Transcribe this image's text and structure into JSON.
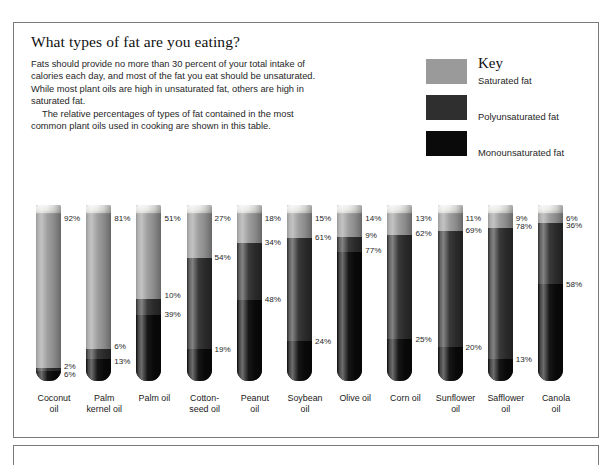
{
  "top_sliver_text": "",
  "panel": {
    "headline": "What types of fat are you eating?",
    "intro_paragraph_1": "Fats should provide no more than 30 percent of your total intake of calories each day, and most of the fat you eat should be unsaturated. While most plant oils are high in unsaturated fat, others are high in saturated fat.",
    "intro_paragraph_2": "The relative percentages of types of fat contained in the most common plant oils used in cooking are shown in this table."
  },
  "key": {
    "title": "Key",
    "items": [
      {
        "label": "Saturated fat",
        "color": "#9a9a9a",
        "swatch_name": "saturated-fat-swatch"
      },
      {
        "label": "Polyunsaturated fat",
        "color": "#2f2f2f",
        "swatch_name": "polyunsaturated-fat-swatch"
      },
      {
        "label": "Monounsaturated fat",
        "color": "#0a0a0a",
        "swatch_name": "monounsaturated-fat-swatch"
      }
    ]
  },
  "chart_data": {
    "type": "bar",
    "title": "What types of fat are you eating?",
    "subtype": "stacked-100-percent-test-tube",
    "xlabel": "",
    "ylabel": "Percent of total fat",
    "ylim": [
      0,
      100
    ],
    "grid": false,
    "legend_position": "top-right",
    "unit": "%",
    "categories": [
      "Coconut oil",
      "Palm kernel oil",
      "Palm oil",
      "Cotton-seed oil",
      "Peanut oil",
      "Soybean oil",
      "Olive oil",
      "Corn oil",
      "Sunflower oil",
      "Safflower oil",
      "Canola oil"
    ],
    "series": [
      {
        "name": "Saturated fat",
        "color": "#9a9a9a",
        "values": [
          92,
          81,
          51,
          27,
          18,
          15,
          14,
          13,
          11,
          9,
          6
        ]
      },
      {
        "name": "Polyunsaturated fat",
        "color": "#2f2f2f",
        "values": [
          2,
          6,
          10,
          54,
          34,
          61,
          9,
          62,
          69,
          78,
          36
        ]
      },
      {
        "name": "Monounsaturated fat",
        "color": "#0a0a0a",
        "values": [
          6,
          13,
          39,
          19,
          48,
          24,
          77,
          25,
          20,
          13,
          58
        ]
      }
    ]
  },
  "tubes": [
    {
      "name_line1": "Coconut",
      "name_line2": "oil",
      "sat": 92,
      "poly": 2,
      "mono": 6,
      "labels": [
        {
          "text": "92%",
          "side": "right",
          "at": 3
        },
        {
          "text": "2%",
          "side": "right",
          "at": 91
        },
        {
          "text": "6%",
          "side": "right",
          "at": 96
        }
      ]
    },
    {
      "name_line1": "Palm",
      "name_line2": "kernel oil",
      "sat": 81,
      "poly": 6,
      "mono": 13,
      "labels": [
        {
          "text": "81%",
          "side": "right",
          "at": 3
        },
        {
          "text": "6%",
          "side": "right",
          "at": 79
        },
        {
          "text": "13%",
          "side": "right",
          "at": 88
        }
      ]
    },
    {
      "name_line1": "Palm oil",
      "name_line2": "",
      "sat": 51,
      "poly": 10,
      "mono": 39,
      "labels": [
        {
          "text": "51%",
          "side": "right",
          "at": 3
        },
        {
          "text": "10%",
          "side": "right",
          "at": 49
        },
        {
          "text": "39%",
          "side": "right",
          "at": 60
        }
      ]
    },
    {
      "name_line1": "Cotton-",
      "name_line2": "seed oil",
      "sat": 27,
      "poly": 54,
      "mono": 19,
      "labels": [
        {
          "text": "27%",
          "side": "right",
          "at": 3
        },
        {
          "text": "54%",
          "side": "right",
          "at": 26
        },
        {
          "text": "19%",
          "side": "right",
          "at": 81
        }
      ]
    },
    {
      "name_line1": "Peanut",
      "name_line2": "oil",
      "sat": 18,
      "poly": 34,
      "mono": 48,
      "labels": [
        {
          "text": "18%",
          "side": "right",
          "at": 3
        },
        {
          "text": "34%",
          "side": "right",
          "at": 17
        },
        {
          "text": "48%",
          "side": "right",
          "at": 51
        }
      ]
    },
    {
      "name_line1": "Soybean",
      "name_line2": "oil",
      "sat": 15,
      "poly": 61,
      "mono": 24,
      "labels": [
        {
          "text": "15%",
          "side": "right",
          "at": 3
        },
        {
          "text": "61%",
          "side": "right",
          "at": 14
        },
        {
          "text": "24%",
          "side": "right",
          "at": 76
        }
      ]
    },
    {
      "name_line1": "Olive oil",
      "name_line2": "",
      "sat": 14,
      "poly": 9,
      "mono": 77,
      "labels": [
        {
          "text": "14%",
          "side": "right",
          "at": 3
        },
        {
          "text": "9%",
          "side": "right",
          "at": 13
        },
        {
          "text": "77%",
          "side": "right",
          "at": 22
        }
      ]
    },
    {
      "name_line1": "Corn oil",
      "name_line2": "",
      "sat": 13,
      "poly": 62,
      "mono": 25,
      "labels": [
        {
          "text": "13%",
          "side": "right",
          "at": 3
        },
        {
          "text": "62%",
          "side": "right",
          "at": 12
        },
        {
          "text": "25%",
          "side": "right",
          "at": 75
        }
      ]
    },
    {
      "name_line1": "Sunflower",
      "name_line2": "oil",
      "sat": 11,
      "poly": 69,
      "mono": 20,
      "labels": [
        {
          "text": "11%",
          "side": "right",
          "at": 3
        },
        {
          "text": "69%",
          "side": "right",
          "at": 10
        },
        {
          "text": "20%",
          "side": "right",
          "at": 80
        }
      ]
    },
    {
      "name_line1": "Safflower",
      "name_line2": "oil",
      "sat": 9,
      "poly": 78,
      "mono": 13,
      "labels": [
        {
          "text": "9%",
          "side": "right",
          "at": 3
        },
        {
          "text": "78%",
          "side": "right",
          "at": 8
        },
        {
          "text": "13%",
          "side": "right",
          "at": 87
        }
      ]
    },
    {
      "name_line1": "Canola",
      "name_line2": "oil",
      "sat": 6,
      "poly": 36,
      "mono": 58,
      "labels": [
        {
          "text": "6%",
          "side": "right",
          "at": 3
        },
        {
          "text": "36%",
          "side": "right",
          "at": 7
        },
        {
          "text": "58%",
          "side": "right",
          "at": 42
        }
      ]
    }
  ]
}
